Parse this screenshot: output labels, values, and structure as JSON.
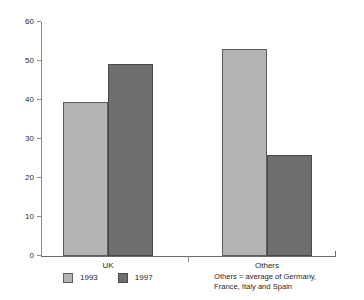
{
  "chart_data": {
    "type": "bar",
    "title": "",
    "subtitle": "",
    "xlabel": "",
    "ylabel": "",
    "categories": [
      "UK",
      "Others"
    ],
    "series": [
      {
        "name": "1993",
        "color": "#b4b4b4",
        "values": [
          39.5,
          53.2
        ]
      },
      {
        "name": "1997",
        "color": "#6e6e6e",
        "values": [
          49.2,
          25.8
        ]
      }
    ],
    "ylim": [
      0,
      60
    ],
    "yticks": [
      0,
      10,
      20,
      30,
      40,
      50,
      60
    ],
    "ytick_labels": [
      "0",
      "10",
      "20",
      "30",
      "40",
      "50",
      "60"
    ],
    "grid": false,
    "legend_position": "bottom-left",
    "annotations": [
      "Others = average of Germany,",
      "France, Italy and Spain"
    ]
  },
  "legend": {
    "entries": [
      {
        "label": "1993",
        "color": "#b4b4b4"
      },
      {
        "label": "1997",
        "color": "#6e6e6e"
      }
    ]
  },
  "axis": {
    "y_ticks": [
      "0",
      "10",
      "20",
      "30",
      "40",
      "50",
      "60"
    ],
    "x_labels": [
      "UK",
      "Others"
    ]
  },
  "footnote": {
    "line1": "Others = average of Germany,",
    "line2": "France, Italy and Spain"
  },
  "colors": {
    "series_1993": "#b4b4b4",
    "series_1997": "#6e6e6e",
    "axis": "#6b6b6b",
    "background": "#ffffff"
  }
}
